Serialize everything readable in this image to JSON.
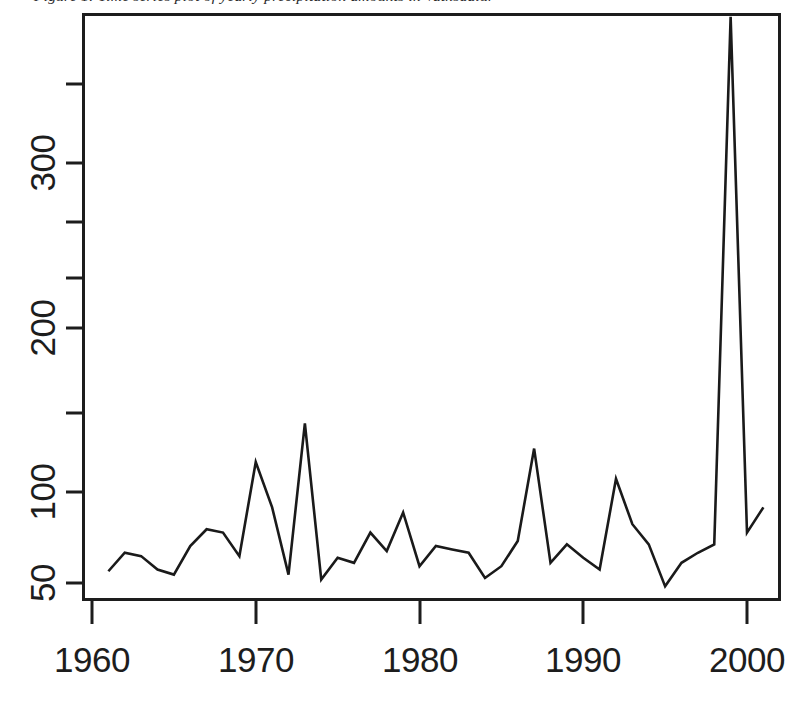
{
  "figure": {
    "caption": "Figure 1:  Time series plot of yearly precipitation amounts in Vatnsdalur",
    "caption_visible_fragment": "f  ...  yearly precipitation amounts in Vatnsd",
    "background_color": "#ffffff",
    "line_color": "#1a1a1a",
    "axis_color": "#1d1d1d"
  },
  "chart_data": {
    "type": "line",
    "title": "",
    "subtitle": "",
    "xlabel": "",
    "ylabel": "",
    "xlim": [
      1961,
      2001
    ],
    "ylim": [
      36,
      392
    ],
    "grid": false,
    "legend": null,
    "x_ticks": [
      1960,
      1970,
      1980,
      1990,
      2000
    ],
    "x_tick_labels": [
      "1960",
      "1970",
      "1980",
      "1990",
      "2000"
    ],
    "y_ticks": [
      50,
      100,
      200,
      300
    ],
    "y_tick_labels": [
      "50",
      "100",
      "200",
      "300"
    ],
    "y_minor_ticks": [
      150,
      250,
      350
    ],
    "y_axis_rotated_labels": true,
    "series": [
      {
        "name": "precipitation",
        "x": [
          1961,
          1962,
          1963,
          1964,
          1965,
          1966,
          1967,
          1968,
          1969,
          1970,
          1971,
          1972,
          1973,
          1974,
          1975,
          1976,
          1977,
          1978,
          1979,
          1980,
          1981,
          1982,
          1983,
          1984,
          1985,
          1986,
          1987,
          1988,
          1989,
          1990,
          1991,
          1992,
          1993,
          1994,
          1995,
          1996,
          1997,
          1998,
          1999,
          2000,
          2001
        ],
        "values": [
          57,
          68,
          66,
          58,
          55,
          72,
          82,
          80,
          66,
          122,
          95,
          55,
          145,
          52,
          65,
          62,
          80,
          69,
          92,
          60,
          72,
          70,
          68,
          53,
          60,
          75,
          130,
          62,
          73,
          65,
          58,
          112,
          85,
          73,
          48,
          62,
          68,
          73,
          387,
          80,
          95
        ]
      }
    ]
  },
  "plot_geometry": {
    "box_left": 83,
    "box_right": 780,
    "box_top": 14,
    "box_bottom": 600
  }
}
